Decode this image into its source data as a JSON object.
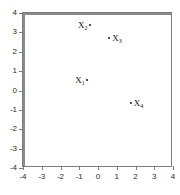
{
  "chart_data": {
    "type": "scatter",
    "title": "",
    "xlabel": "",
    "ylabel": "",
    "xlim": [
      -4,
      4
    ],
    "ylim": [
      -4,
      4
    ],
    "grid": false,
    "legend": "none",
    "x_ticks": [
      "-4",
      "-3",
      "-2",
      "-1",
      "0",
      "1",
      "2",
      "3",
      "4"
    ],
    "x_tick_values": [
      -4,
      -3,
      -2,
      -1,
      0,
      1,
      2,
      3,
      4
    ],
    "y_ticks": [
      "4",
      "3",
      "2",
      "1",
      "0",
      "-1",
      "-2",
      "-3",
      "-4"
    ],
    "y_tick_values": [
      4,
      3,
      2,
      1,
      0,
      -1,
      -2,
      -3,
      -4
    ],
    "points": [
      {
        "label": "X",
        "subscript": "1",
        "x": -0.6,
        "y": 0.55,
        "label_side": "left"
      },
      {
        "label": "X",
        "subscript": "2",
        "x": -0.45,
        "y": 3.4,
        "label_side": "left"
      },
      {
        "label": "X",
        "subscript": "3",
        "x": 0.6,
        "y": 2.7,
        "label_side": "right"
      },
      {
        "label": "X",
        "subscript": "4",
        "x": 1.75,
        "y": -0.65,
        "label_side": "right"
      }
    ]
  },
  "style": {
    "axis_color": "#8a8a8a",
    "frame_color": "#7d7d7d",
    "point_color": "#1a1a1a",
    "label_color": "#111111",
    "background": "#ffffff"
  }
}
